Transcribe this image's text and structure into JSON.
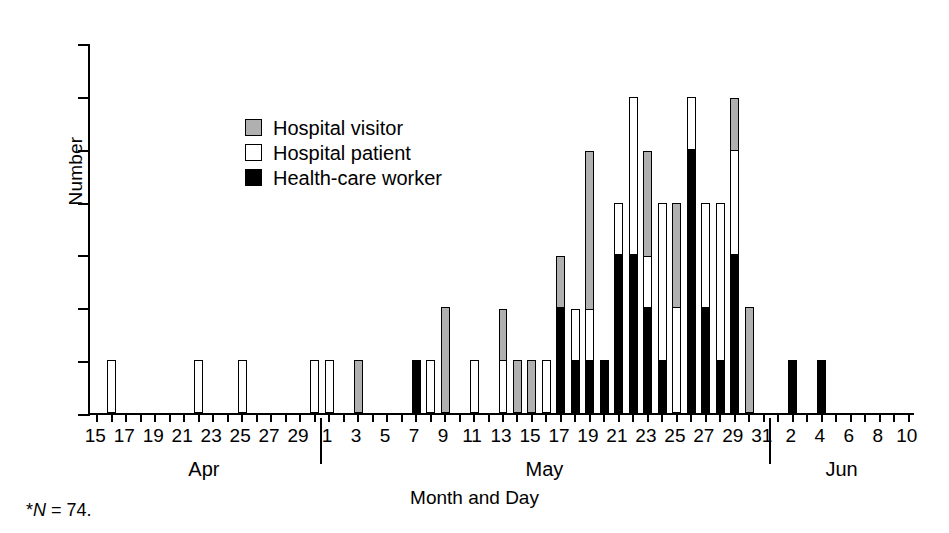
{
  "chart_data": {
    "type": "bar",
    "title": "",
    "subtitle": "",
    "xlabel": "Month and Day",
    "ylabel": "Number",
    "ylim": [
      0,
      7
    ],
    "ytick_values": [
      0,
      1,
      2,
      3,
      4,
      5,
      6,
      7
    ],
    "grid": false,
    "stacked": true,
    "legend_position": "upper-left-inside",
    "footnote": "*N = 74.",
    "months": [
      {
        "name": "Apr",
        "start_day": 15,
        "end_day": 30
      },
      {
        "name": "May",
        "start_day": 1,
        "end_day": 31
      },
      {
        "name": "Jun",
        "start_day": 1,
        "end_day": 10
      }
    ],
    "xtick_labels": [
      "15",
      "17",
      "19",
      "21",
      "23",
      "25",
      "27",
      "29",
      "1",
      "3",
      "5",
      "7",
      "9",
      "11",
      "13",
      "15",
      "17",
      "19",
      "21",
      "23",
      "25",
      "27",
      "29",
      "31",
      "2",
      "4",
      "6",
      "8",
      "10"
    ],
    "series": [
      {
        "name": "Health-care worker",
        "color": "#000000",
        "fill": "black"
      },
      {
        "name": "Hospital patient",
        "color": "#ffffff",
        "fill": "white"
      },
      {
        "name": "Hospital visitor",
        "color": "#b0b0b0",
        "fill": "gray"
      }
    ],
    "categories": [
      "Apr 15",
      "Apr 16",
      "Apr 17",
      "Apr 18",
      "Apr 19",
      "Apr 20",
      "Apr 21",
      "Apr 22",
      "Apr 23",
      "Apr 24",
      "Apr 25",
      "Apr 26",
      "Apr 27",
      "Apr 28",
      "Apr 29",
      "Apr 30",
      "May 1",
      "May 2",
      "May 3",
      "May 4",
      "May 5",
      "May 6",
      "May 7",
      "May 8",
      "May 9",
      "May 10",
      "May 11",
      "May 12",
      "May 13",
      "May 14",
      "May 15",
      "May 16",
      "May 17",
      "May 18",
      "May 19",
      "May 20",
      "May 21",
      "May 22",
      "May 23",
      "May 24",
      "May 25",
      "May 26",
      "May 27",
      "May 28",
      "May 29",
      "May 30",
      "May 31",
      "Jun 1",
      "Jun 2",
      "Jun 3",
      "Jun 4",
      "Jun 5",
      "Jun 6",
      "Jun 7",
      "Jun 8",
      "Jun 9",
      "Jun 10"
    ],
    "values": {
      "Health-care worker": [
        0,
        0,
        0,
        0,
        0,
        0,
        0,
        0,
        0,
        0,
        0,
        0,
        0,
        0,
        0,
        0,
        0,
        0,
        0,
        0,
        0,
        0,
        1,
        0,
        0,
        0,
        0,
        0,
        0,
        0,
        0,
        0,
        2,
        1,
        1,
        1,
        3,
        3,
        2,
        1,
        0,
        5,
        2,
        1,
        3,
        0,
        0,
        0,
        1,
        0,
        1,
        0,
        0,
        0,
        0,
        0,
        0
      ],
      "Hospital patient": [
        0,
        1,
        0,
        0,
        0,
        0,
        0,
        1,
        0,
        0,
        1,
        0,
        0,
        0,
        0,
        1,
        1,
        0,
        0,
        0,
        0,
        0,
        0,
        1,
        0,
        0,
        1,
        0,
        1,
        0,
        0,
        1,
        0,
        1,
        1,
        0,
        1,
        3,
        1,
        3,
        2,
        1,
        2,
        3,
        2,
        0,
        0,
        0,
        0,
        0,
        0,
        0,
        0,
        0,
        0,
        0,
        0
      ],
      "Hospital visitor": [
        0,
        0,
        0,
        0,
        0,
        0,
        0,
        0,
        0,
        0,
        0,
        0,
        0,
        0,
        0,
        0,
        0,
        0,
        1,
        0,
        0,
        0,
        0,
        0,
        2,
        0,
        0,
        0,
        1,
        1,
        1,
        0,
        1,
        0,
        3,
        0,
        0,
        0,
        2,
        0,
        2,
        0,
        0,
        0,
        1,
        2,
        0,
        0,
        0,
        0,
        0,
        0,
        0,
        0,
        0,
        0,
        0
      ]
    },
    "totals": [
      0,
      1,
      0,
      0,
      0,
      0,
      0,
      1,
      0,
      0,
      1,
      0,
      0,
      0,
      0,
      1,
      1,
      0,
      1,
      0,
      0,
      0,
      1,
      1,
      2,
      0,
      1,
      0,
      2,
      1,
      1,
      1,
      3,
      2,
      5,
      1,
      4,
      6,
      5,
      4,
      4,
      6,
      4,
      4,
      6,
      2,
      0,
      0,
      1,
      0,
      1,
      0,
      0,
      0,
      0,
      0,
      0
    ],
    "total_n": 74
  },
  "legend": {
    "items": [
      {
        "label": "Hospital visitor",
        "swatch": "gray"
      },
      {
        "label": "Hospital patient",
        "swatch": "white"
      },
      {
        "label": "Health-care worker",
        "swatch": "black"
      }
    ]
  },
  "axes": {
    "y_title": "Number",
    "x_title": "Month and Day"
  },
  "footnote": {
    "marker": "*",
    "symbol": "N",
    "rest": " = 74."
  }
}
